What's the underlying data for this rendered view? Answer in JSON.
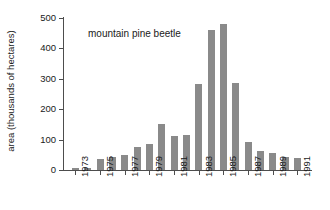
{
  "chart_data": {
    "type": "bar",
    "title": "",
    "annotation": "mountain pine beetle",
    "xlabel": "",
    "ylabel": "area (thousands of hectares)",
    "ylim": [
      0,
      500
    ],
    "yticks": [
      0,
      100,
      200,
      300,
      400,
      500
    ],
    "ytick_labels": [
      "0",
      "100",
      "200",
      "300",
      "400",
      "500"
    ],
    "grid": false,
    "legend": null,
    "bar_color": "#8a8a8a",
    "axis_color": "#4d4d4d",
    "text_color": "#1a1a1a",
    "categories": [
      "1973",
      "1974",
      "1975",
      "1976",
      "1977",
      "1978",
      "1979",
      "1980",
      "1981",
      "1982",
      "1983",
      "1984",
      "1985",
      "1986",
      "1987",
      "1988",
      "1989",
      "1990",
      "1991"
    ],
    "xtick_labels": [
      "1973",
      "1975",
      "1977",
      "1979",
      "1981",
      "1983",
      "1985",
      "1987",
      "1989",
      "1991"
    ],
    "values": [
      5,
      8,
      37,
      44,
      50,
      75,
      84,
      153,
      113,
      114,
      284,
      460,
      480,
      285,
      92,
      62,
      55,
      43,
      41
    ]
  }
}
